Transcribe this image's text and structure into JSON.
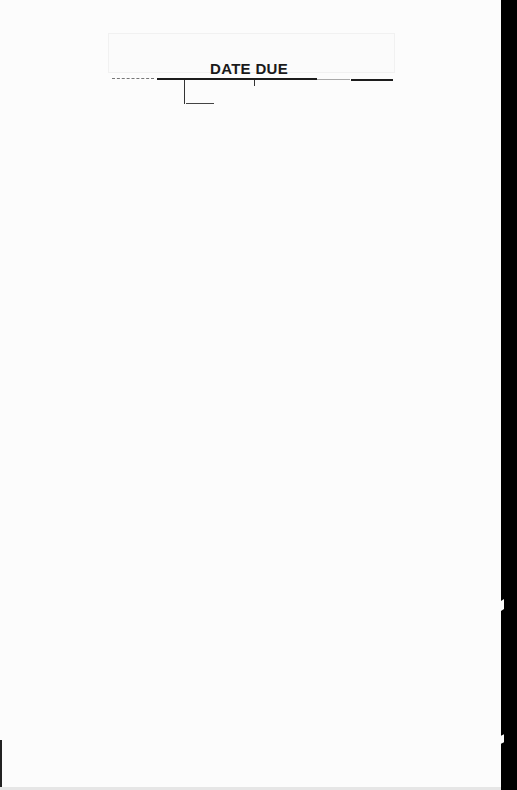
{
  "document": {
    "type": "library date due slip",
    "title": "DATE DUE",
    "entries": []
  },
  "colors": {
    "paper": "#fcfcfc",
    "ink": "#1a1a1a",
    "scan_border": "#000000"
  }
}
